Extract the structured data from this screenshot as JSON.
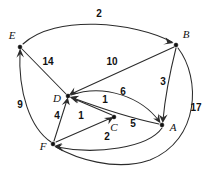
{
  "diagram": {
    "type": "directed-weighted-graph",
    "background_color": "#ffffff",
    "edge_color": "#2b2b2b",
    "node_color": "#111111",
    "nodes": [
      {
        "id": "E",
        "label": "E",
        "x": 20,
        "y": 47,
        "label_x": 12,
        "label_y": 36
      },
      {
        "id": "B",
        "label": "B",
        "x": 176,
        "y": 45,
        "label_x": 186,
        "label_y": 35
      },
      {
        "id": "D",
        "label": "D",
        "x": 68,
        "y": 96,
        "label_x": 57,
        "label_y": 99
      },
      {
        "id": "C",
        "label": "C",
        "x": 114,
        "y": 117,
        "label_x": 114,
        "label_y": 128
      },
      {
        "id": "A",
        "label": "A",
        "x": 162,
        "y": 125,
        "label_x": 173,
        "label_y": 128
      },
      {
        "id": "F",
        "label": "F",
        "x": 53,
        "y": 144,
        "label_x": 43,
        "label_y": 147
      }
    ],
    "edges": [
      {
        "id": "e-b",
        "from": "E",
        "to": "B",
        "weight": "2",
        "label_x": 99,
        "label_y": 14,
        "shape": "arc-up"
      },
      {
        "id": "e-d",
        "from": "E",
        "to": "D",
        "weight": "14",
        "label_x": 48,
        "label_y": 62,
        "shape": "line"
      },
      {
        "id": "f-e",
        "from": "F",
        "to": "E",
        "weight": "9",
        "label_x": 20,
        "label_y": 105,
        "shape": "arc-left"
      },
      {
        "id": "b-d",
        "from": "B",
        "to": "D",
        "weight": "10",
        "label_x": 112,
        "label_y": 62,
        "shape": "line"
      },
      {
        "id": "b-a",
        "from": "B",
        "to": "A",
        "weight": "3",
        "label_x": 163,
        "label_y": 82,
        "shape": "arc-slight"
      },
      {
        "id": "b-f",
        "from": "B",
        "to": "F",
        "weight": "17",
        "label_x": 196,
        "label_y": 108,
        "shape": "arc-outer-right"
      },
      {
        "id": "d-a",
        "from": "D",
        "to": "A",
        "weight": "6",
        "label_x": 123,
        "label_y": 92,
        "shape": "arc-over-c"
      },
      {
        "id": "c-d",
        "from": "C",
        "to": "D",
        "weight": "1",
        "label_x": 105,
        "label_y": 100,
        "shape": "line"
      },
      {
        "id": "f-d",
        "from": "F",
        "to": "D",
        "weight": "4",
        "label_x": 57,
        "label_y": 116,
        "shape": "line"
      },
      {
        "id": "f-c",
        "from": "F",
        "to": "C",
        "weight": "1",
        "label_x": 81,
        "label_y": 116,
        "shape": "line"
      },
      {
        "id": "a-d",
        "from": "A",
        "to": "D",
        "weight": "5",
        "label_x": 133,
        "label_y": 124,
        "shape": "arc-under"
      },
      {
        "id": "a-f",
        "from": "A",
        "to": "F",
        "weight": "2",
        "label_x": 107,
        "label_y": 137,
        "shape": "arc-under-low"
      }
    ]
  }
}
